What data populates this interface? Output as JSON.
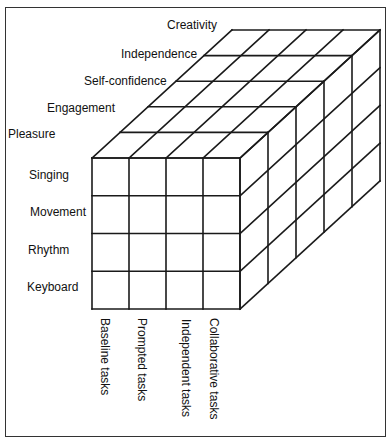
{
  "diagram": {
    "type": "3d-grid-cube",
    "front_rows": [
      "Singing",
      "Movement",
      "Rhythm",
      "Keyboard"
    ],
    "front_columns": [
      "Baseline tasks",
      "Prompted tasks",
      "Independent tasks",
      "Collaborative tasks"
    ],
    "depth_layers": [
      "Pleasure",
      "Engagement",
      "Self-confidence",
      "Independence",
      "Creativity"
    ],
    "line_color": "#1a1a1a",
    "geometry": {
      "front_x0": 92,
      "front_y0": 158,
      "cell_w": 37,
      "cell_h": 37.75,
      "depth_dx": 28,
      "depth_dy": -25.6
    }
  },
  "labels": {
    "depth": [
      {
        "text": "Pleasure",
        "x": 8,
        "y": 127
      },
      {
        "text": "Engagement",
        "x": 47,
        "y": 101
      },
      {
        "text": "Self-confidence",
        "x": 84,
        "y": 74
      },
      {
        "text": "Independence",
        "x": 121,
        "y": 47
      },
      {
        "text": "Creativity",
        "x": 167,
        "y": 18
      }
    ],
    "rows": [
      {
        "text": "Singing",
        "x": 29,
        "y": 168
      },
      {
        "text": "Movement",
        "x": 30,
        "y": 205
      },
      {
        "text": "Rhythm",
        "x": 28,
        "y": 243
      },
      {
        "text": "Keyboard",
        "x": 27,
        "y": 280
      }
    ],
    "columns": [
      {
        "text": "Baseline tasks",
        "x": 112,
        "y": 318
      },
      {
        "text": "Prompted tasks",
        "x": 149,
        "y": 318
      },
      {
        "text": "Independent tasks",
        "x": 193,
        "y": 319
      },
      {
        "text": "Collaborative tasks",
        "x": 221,
        "y": 318
      }
    ]
  }
}
